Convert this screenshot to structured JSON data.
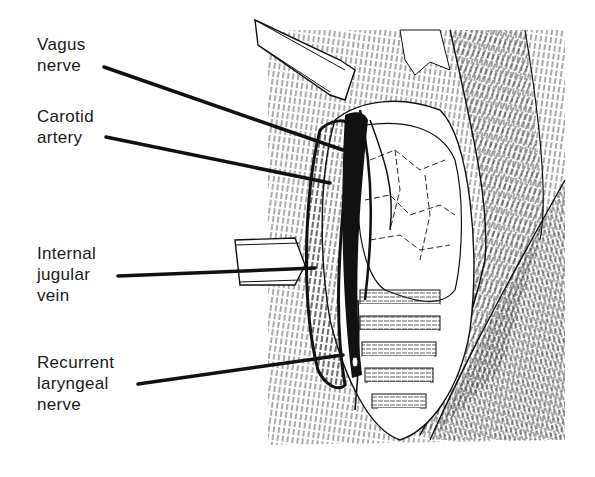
{
  "figure": {
    "labels": [
      {
        "id": "vagus-nerve",
        "lines": [
          "Vagus",
          "nerve"
        ]
      },
      {
        "id": "carotid-artery",
        "lines": [
          "Carotid",
          "artery"
        ]
      },
      {
        "id": "internal-jugular-vein",
        "lines": [
          "Internal",
          "jugular",
          "vein"
        ]
      },
      {
        "id": "recurrent-laryngeal-nerve",
        "lines": [
          "Recurrent",
          "laryngeal",
          "nerve"
        ]
      }
    ],
    "colors": {
      "ink": "#111111",
      "paper": "#ffffff"
    }
  }
}
